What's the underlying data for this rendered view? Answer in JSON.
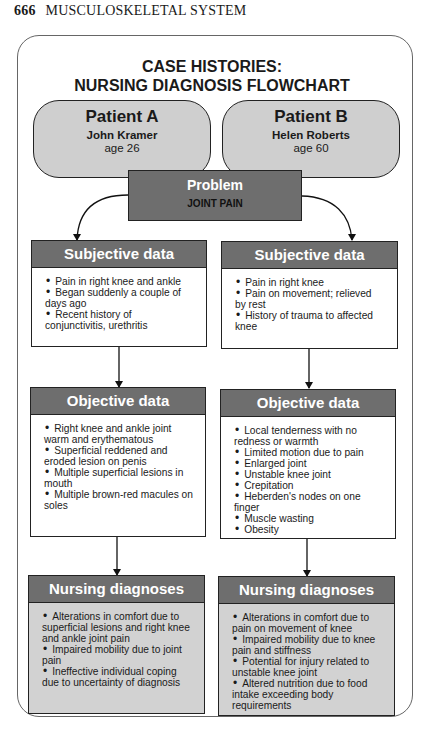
{
  "page_header": {
    "page_number": "666",
    "section": "MUSCULOSKELETAL SYSTEM"
  },
  "title": {
    "line1": "CASE HISTORIES:",
    "line2": "NURSING DIAGNOSIS FLOWCHART"
  },
  "patients": [
    {
      "label": "Patient A",
      "name": "John Kramer",
      "age": "age 26"
    },
    {
      "label": "Patient B",
      "name": "Helen Roberts",
      "age": "age 60"
    }
  ],
  "problem": {
    "title": "Problem",
    "value": "JOINT PAIN"
  },
  "columns": [
    {
      "subjective": {
        "title": "Subjective data",
        "items": [
          "Pain in right knee and ankle",
          "Began suddenly a couple of days ago",
          "Recent history of conjunctivitis, urethritis"
        ]
      },
      "objective": {
        "title": "Objective data",
        "items": [
          "Right knee and ankle joint warm and erythematous",
          "Superficial reddened and eroded lesion on penis",
          "Multiple superficial lesions in mouth",
          "Multiple brown-red macules on soles"
        ]
      },
      "diagnoses": {
        "title": "Nursing diagnoses",
        "items": [
          "Alterations in comfort due to superficial lesions and right knee and ankle joint pain",
          "Impaired mobility due to joint pain",
          "Ineffective individual coping due to uncertainty of diagnosis"
        ]
      }
    },
    {
      "subjective": {
        "title": "Subjective data",
        "items": [
          "Pain in right knee",
          "Pain on movement; relieved by rest",
          "History of trauma to affected knee"
        ]
      },
      "objective": {
        "title": "Objective data",
        "items": [
          "Local tenderness with no redness or warmth",
          "Limited motion due to pain",
          "Enlarged joint",
          "Unstable knee joint",
          "Crepitation",
          "Heberden's nodes on one finger",
          "Muscle wasting",
          "Obesity"
        ]
      },
      "diagnoses": {
        "title": "Nursing diagnoses",
        "items": [
          "Alterations in comfort due to pain on movement of knee",
          "Impaired mobility due to knee pain and stiffness",
          "Potential for injury related to unstable knee joint",
          "Altered nutrition due to food intake exceeding body requirements"
        ]
      }
    }
  ],
  "colors": {
    "header_fill": "#6e6e6e",
    "oval_fill": "#cfcfcf",
    "diagnosis_fill": "#d2d2d2"
  }
}
